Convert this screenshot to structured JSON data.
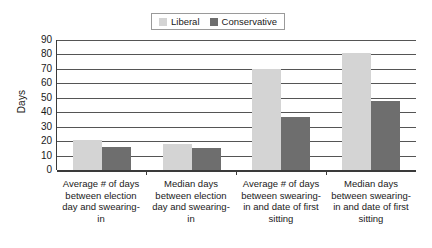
{
  "chart_data": {
    "type": "bar",
    "title": "",
    "xlabel": "",
    "ylabel": "Days",
    "ylim": [
      0,
      90
    ],
    "ytick_step": 10,
    "yticks": [
      90,
      80,
      70,
      60,
      50,
      40,
      30,
      20,
      10,
      0
    ],
    "grid": true,
    "legend_position": "top-center",
    "categories": [
      "Average # of days between election day and swearing-in",
      "Median days between election day and swearing-in",
      "Average # of days between swearing-in and date of first sitting",
      "Median days between swearing-in and date of first sitting"
    ],
    "series": [
      {
        "name": "Liberal",
        "color": "#d4d4d4",
        "values": [
          21,
          18,
          70,
          81
        ]
      },
      {
        "name": "Conservative",
        "color": "#6e6e6e",
        "values": [
          16,
          15,
          37,
          48
        ]
      }
    ]
  },
  "legend": {
    "items": [
      {
        "label": "Liberal",
        "color": "#d4d4d4"
      },
      {
        "label": "Conservative",
        "color": "#6e6e6e"
      }
    ]
  },
  "axis": {
    "y_title": "Days"
  }
}
